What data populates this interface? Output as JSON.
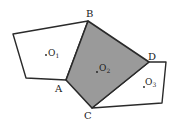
{
  "diagram": {
    "type": "geometry-figure",
    "colors": {
      "stroke": "#2a2a2a",
      "shaded_fill": "#9a9a9a",
      "background": "#ffffff"
    },
    "vertices": {
      "B": {
        "label": "B",
        "x": 88,
        "y": 21
      },
      "A": {
        "label": "A",
        "x": 66,
        "y": 80
      },
      "C": {
        "label": "C",
        "x": 92,
        "y": 108
      },
      "D": {
        "label": "D",
        "x": 149,
        "y": 62
      }
    },
    "vertex_labels": [
      {
        "text": "B",
        "x": 86,
        "y": 17
      },
      {
        "text": "A",
        "x": 55,
        "y": 92
      },
      {
        "text": "C",
        "x": 84,
        "y": 119
      },
      {
        "text": "D",
        "x": 148,
        "y": 60
      }
    ],
    "centers": [
      {
        "name": "O1",
        "main": "O",
        "sub": "1",
        "dot_x": 46,
        "dot_y": 56,
        "x": 48,
        "y": 56
      },
      {
        "name": "O2",
        "main": "O",
        "sub": "2",
        "dot_x": 99,
        "dot_y": 73,
        "x": 99,
        "y": 72
      },
      {
        "name": "O3",
        "main": "O",
        "sub": "3",
        "dot_x": 144,
        "dot_y": 88,
        "x": 145,
        "y": 86
      }
    ],
    "polygons": {
      "left": "13,34 88,21 66,80 26,78",
      "middle_shaded": "88,21 149,62 92,108 66,80",
      "right": "149,62 166,62 162,103 92,108"
    }
  }
}
